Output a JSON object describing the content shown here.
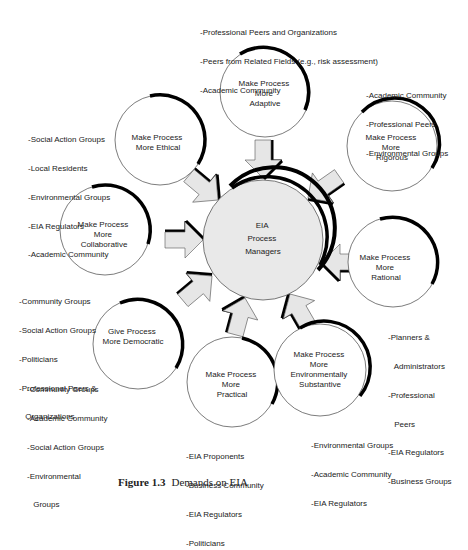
{
  "center": {
    "lines": [
      "EIA",
      "Process",
      "Managers"
    ]
  },
  "nodes": [
    {
      "id": "adaptive",
      "lines": [
        "Make Process",
        "More",
        "Adaptive"
      ],
      "stakeholders": [
        "-Professional Peers and Organizations",
        "-Peers from Related Fields (e.g., risk assessment)",
        "-Academic Community"
      ]
    },
    {
      "id": "rigorous",
      "lines": [
        "Make Process",
        "More",
        "Rigorous"
      ],
      "stakeholders": [
        "-Academic Community",
        "-Professional Peers",
        "-Environmental Groups"
      ]
    },
    {
      "id": "ethical",
      "lines": [
        "Make Process",
        "More Ethical"
      ],
      "stakeholders": [
        "-Social Action Groups",
        "-Local Residents",
        "-Environmental Groups",
        "-EIA Regulators",
        "-Academic Community"
      ]
    },
    {
      "id": "collaborative",
      "lines": [
        "Make Process",
        "More",
        "Collaborative"
      ],
      "stakeholders": [
        "-Community Groups",
        "-Social Action Groups",
        "-Politicians",
        "-Professional Peers &",
        " Organizations"
      ]
    },
    {
      "id": "rational",
      "lines": [
        "Make Process",
        "More",
        "Rational"
      ],
      "stakeholders": [
        "-Planners &",
        " Administrators",
        "-Professional",
        " Peers",
        "-EIA Regulators",
        "-Business Groups"
      ]
    },
    {
      "id": "democratic",
      "lines": [
        "Give Process",
        "More Democratic"
      ],
      "stakeholders": [
        "-Community Groups",
        "-Academic Community",
        "-Social Action Groups",
        "-Environmental",
        " Groups"
      ]
    },
    {
      "id": "practical",
      "lines": [
        "Make Process",
        "More",
        "Practical"
      ],
      "stakeholders": [
        "-EIA Proponents",
        "-Business Community",
        "-EIA Regulators",
        "-Politicians"
      ]
    },
    {
      "id": "environmental",
      "lines": [
        "Make Process",
        "More",
        "Environmentally",
        "Substantive"
      ],
      "stakeholders": [
        "-Environmental Groups",
        "-Academic Community",
        "-EIA Regulators"
      ]
    }
  ],
  "caption": {
    "label": "Figure 1.3",
    "text": "Demands on EIA"
  },
  "colors": {
    "circle_fill": "#ffffff",
    "center_fill": "#e9e9e9",
    "arrow_fill": "#e6e6e6",
    "outline": "#333333",
    "shadow": "#000000"
  }
}
